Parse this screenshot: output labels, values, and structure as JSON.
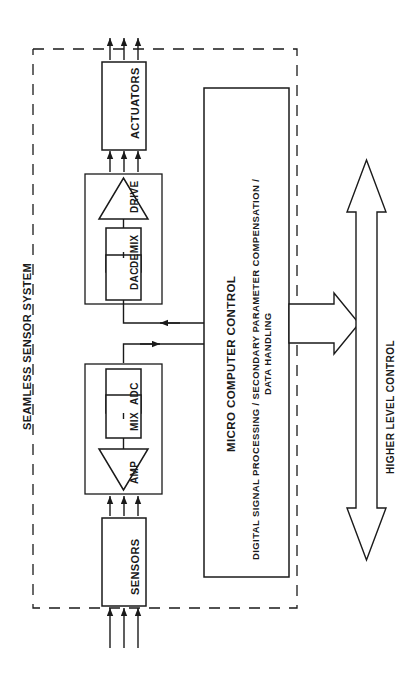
{
  "diagram": {
    "title": "SEAMLESS SENSOR SYSTEM",
    "orientation": "rotated-90-ccw",
    "boundary_label": "SEAMLESS SENSOR SYSTEM",
    "blocks": {
      "actuators": "ACTUATORS",
      "sensors": "SENSORS",
      "dac": "DAC",
      "demix": "DEMIX",
      "drive": "DRIVE",
      "amp": "AMP",
      "mix": "MIX",
      "adc": "ADC"
    },
    "controller": {
      "title": "MICRO COMPUTER CONTROL",
      "subtitle_line1": "DIGITAL SIGNAL PROCESSING / SECONDARY PARAMETER COMPENSATION /",
      "subtitle_line2": "DATA HANDLING"
    },
    "external": {
      "higher_level_control": "HIGHER LEVEL CONTROL"
    },
    "colors": {
      "stroke": "#1a1a1a",
      "background": "#ffffff",
      "text": "#1a1a1a"
    }
  }
}
